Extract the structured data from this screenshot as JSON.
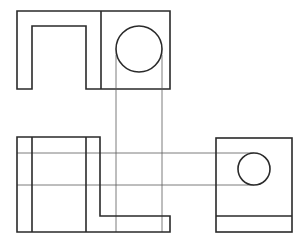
{
  "diagram": {
    "type": "orthographic-projection",
    "views": [
      "front-view",
      "top-view",
      "side-view"
    ],
    "colors": {
      "background": "#ffffff",
      "object_line": "#2a2a2a",
      "projection_line": "#5a5a5a"
    },
    "front_view": {
      "outer_left": 17,
      "top": 11,
      "bottom": 89,
      "divider_x": 101,
      "right": 170,
      "slot_left": 32,
      "slot_right": 86,
      "slot_top": 26,
      "circle": {
        "cx": 139,
        "cy": 49,
        "r": 23
      }
    },
    "top_view": {
      "left": 17,
      "top": 137,
      "bottom": 232,
      "inner_lines_x": [
        32,
        86
      ],
      "upper_right_x": 100,
      "step_y": 216,
      "right": 170,
      "horizontal_lines_y": [
        153,
        185
      ]
    },
    "side_view": {
      "left": 216,
      "right": 292,
      "top": 138,
      "bottom": 232,
      "base_line_y": 216,
      "circle": {
        "cx": 254,
        "cy": 169,
        "r": 16
      }
    },
    "projection_lines": {
      "vertical_x": [
        116,
        162
      ],
      "vertical_from_y": 72,
      "vertical_to_y": 232,
      "horizontal_y": [
        153,
        185
      ],
      "horizontal_to_x": 254
    }
  }
}
